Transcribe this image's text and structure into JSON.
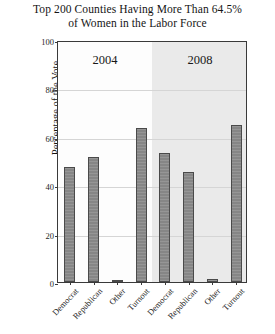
{
  "chart_data": {
    "type": "bar",
    "title": "Top 200 Counties Having More Than 64.5% of Women in the Labor Force",
    "title_lines": [
      "Top 200 Counties Having More Than 64.5%",
      "of Women in the Labor Force"
    ],
    "xlabel": "",
    "ylabel": "Percentage of the Vote",
    "ylim": [
      0,
      100
    ],
    "yticks": [
      0,
      20,
      40,
      60,
      80,
      100
    ],
    "ytick_labels": [
      "0",
      "20",
      "40",
      "60",
      "80",
      "100"
    ],
    "grid": true,
    "legend": "none",
    "panels": [
      {
        "label": "2004",
        "categories": [
          "Democrat",
          "Republican",
          "Other",
          "Turnout"
        ],
        "values": [
          47.5,
          51.5,
          1.0,
          63.5
        ]
      },
      {
        "label": "2008",
        "categories": [
          "Democrat",
          "Republican",
          "Other",
          "Turnout"
        ],
        "values": [
          53.5,
          45.5,
          1.2,
          64.8
        ]
      }
    ],
    "colors": {
      "bar_fill": "#868686",
      "bar_edge": "#4a4a4a",
      "panel_shade": "#e6e6e6",
      "grid": "#d5d5d5",
      "frame": "#3a3a3a",
      "text": "#141414",
      "background": "#ffffff"
    }
  }
}
